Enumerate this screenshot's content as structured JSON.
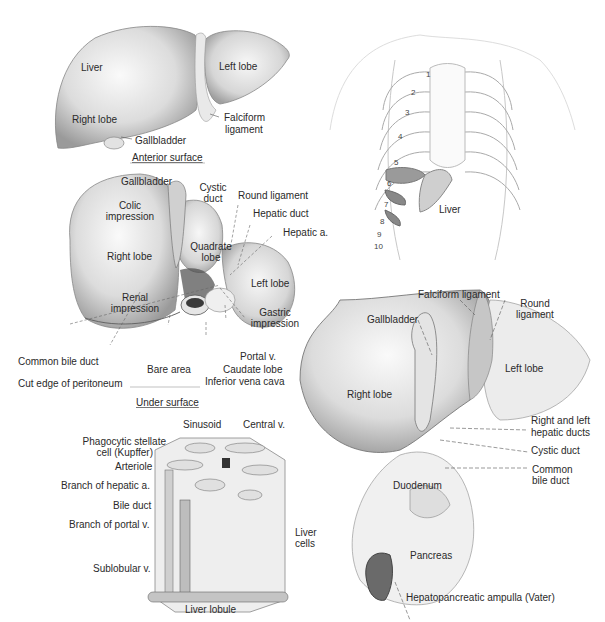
{
  "panels": {
    "anterior": {
      "caption": "Anterior surface",
      "labels": {
        "liver": "Liver",
        "right_lobe": "Right lobe",
        "left_lobe": "Left lobe",
        "gallbladder": "Gallbladder",
        "falciform_1": "Falciform",
        "falciform_2": "ligament"
      }
    },
    "thorax": {
      "rib_numbers": [
        "1",
        "2",
        "3",
        "4",
        "5",
        "6",
        "7",
        "8",
        "9",
        "10"
      ],
      "liver": "Liver"
    },
    "under": {
      "caption": "Under surface",
      "labels": {
        "gallbladder": "Gallbladder",
        "cystic_1": "Cystic",
        "cystic_2": "duct",
        "round_ligament": "Round ligament",
        "hepatic_duct": "Hepatic duct",
        "hepatic_a": "Hepatic a.",
        "colic_1": "Colic",
        "colic_2": "impression",
        "right_lobe": "Right lobe",
        "quadrate_1": "Quadrate",
        "quadrate_2": "lobe",
        "left_lobe": "Left lobe",
        "renal_1": "Renal",
        "renal_2": "impression",
        "gastric_1": "Gastric",
        "gastric_2": "impression",
        "common_bile_duct": "Common bile duct",
        "portal_v": "Portal v.",
        "bare_area": "Bare area",
        "caudate_lobe": "Caudate lobe",
        "cut_edge": "Cut edge of peritoneum",
        "ivc": "Inferior vena cava"
      }
    },
    "lobule": {
      "caption": "Liver lobule",
      "labels": {
        "sinusoid": "Sinusoid",
        "central_v": "Central v.",
        "kupffer_1": "Phagocytic stellate",
        "kupffer_2": "cell (Kupffer)",
        "arteriole": "Arteriole",
        "branch_hepatic": "Branch of hepatic a.",
        "bile_duct": "Bile duct",
        "branch_portal": "Branch of portal v.",
        "sublobular": "Sublobular v.",
        "liver_cells_1": "Liver",
        "liver_cells_2": "cells"
      }
    },
    "ducts": {
      "labels": {
        "falciform": "Falciform ligament",
        "round_1": "Round",
        "round_2": "ligament",
        "gallbladder": "Gallbladder",
        "left_lobe": "Left lobe",
        "right_lobe": "Right lobe",
        "rl_hepatic_1": "Right and left",
        "rl_hepatic_2": "hepatic ducts",
        "cystic_duct": "Cystic duct",
        "common_1": "Common",
        "common_2": "bile duct",
        "duodenum": "Duodenum",
        "pancreas": "Pancreas",
        "ampulla": "Hepatopancreatic ampulla (Vater)"
      }
    }
  }
}
